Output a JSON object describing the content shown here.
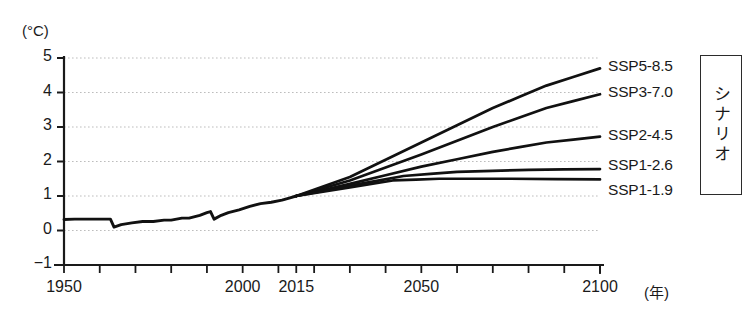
{
  "chart_data": {
    "type": "line",
    "title": "",
    "xlabel": "(年)",
    "ylabel": "(°C)",
    "xlim": [
      1950,
      2100
    ],
    "ylim": [
      -1,
      5
    ],
    "grid": true,
    "legend_position": "right-of-plot",
    "y_ticks": [
      "5",
      "4",
      "3",
      "2",
      "1",
      "0",
      "-1"
    ],
    "y_tick_values": [
      5,
      4,
      3,
      2,
      1,
      0,
      -1
    ],
    "x_ticks": [
      "1950",
      "2000",
      "2015",
      "2050",
      "2100"
    ],
    "x_tick_values": [
      1950,
      2000,
      2015,
      2050,
      2100
    ],
    "x_minor_tick_values": [
      1960,
      1970,
      1980,
      1990,
      2010,
      2020,
      2030,
      2040,
      2060,
      2070,
      2080,
      2090
    ],
    "historical": {
      "name": "historical",
      "x": [
        1950,
        1953,
        1956,
        1959,
        1961,
        1963,
        1964,
        1966,
        1969,
        1972,
        1975,
        1978,
        1980,
        1983,
        1985,
        1988,
        1990,
        1991,
        1992,
        1994,
        1996,
        1999,
        2002,
        2005,
        2008,
        2011,
        2013,
        2015
      ],
      "values": [
        0.32,
        0.33,
        0.33,
        0.33,
        0.33,
        0.33,
        0.1,
        0.17,
        0.22,
        0.26,
        0.26,
        0.3,
        0.3,
        0.36,
        0.36,
        0.44,
        0.52,
        0.55,
        0.33,
        0.44,
        0.52,
        0.6,
        0.7,
        0.78,
        0.82,
        0.88,
        0.94,
        1.0
      ]
    },
    "series": [
      {
        "name": "SSP5-8.5",
        "label": "SSP5-8.5",
        "x": [
          2015,
          2030,
          2050,
          2070,
          2085,
          2100
        ],
        "values": [
          1.0,
          1.55,
          2.55,
          3.55,
          4.2,
          4.7
        ]
      },
      {
        "name": "SSP3-7.0",
        "label": "SSP3-7.0",
        "x": [
          2015,
          2030,
          2050,
          2070,
          2085,
          2100
        ],
        "values": [
          1.0,
          1.45,
          2.2,
          3.0,
          3.55,
          3.95
        ]
      },
      {
        "name": "SSP2-4.5",
        "label": "SSP2-4.5",
        "x": [
          2015,
          2030,
          2050,
          2070,
          2085,
          2100
        ],
        "values": [
          1.0,
          1.35,
          1.85,
          2.28,
          2.55,
          2.72
        ]
      },
      {
        "name": "SSP1-2.6",
        "label": "SSP1-2.6",
        "x": [
          2015,
          2030,
          2045,
          2060,
          2080,
          2100
        ],
        "values": [
          1.0,
          1.3,
          1.58,
          1.7,
          1.76,
          1.78
        ]
      },
      {
        "name": "SSP1-1.9",
        "label": "SSP1-1.9",
        "x": [
          2015,
          2030,
          2042,
          2055,
          2075,
          2100
        ],
        "values": [
          1.0,
          1.25,
          1.45,
          1.5,
          1.5,
          1.48
        ]
      }
    ],
    "legend_box": {
      "text": "シナリオ"
    },
    "colors": {
      "line": "#111111",
      "grid": "#bdbdbd",
      "axis": "#1a1a1a",
      "text": "#1a1a1a"
    }
  }
}
